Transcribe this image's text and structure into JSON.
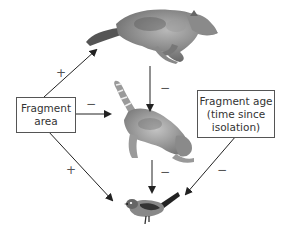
{
  "diagram": {
    "nodes": {
      "fragment_area": {
        "lines": [
          "Fragment",
          "area"
        ]
      },
      "fragment_age": {
        "lines": [
          "Fragment age",
          "(time since",
          "isolation)"
        ]
      },
      "coyote": {
        "label": "coyote (top predator)"
      },
      "cat": {
        "label": "cat (mesopredator)"
      },
      "bird": {
        "label": "songbird (prey)"
      }
    },
    "edges": [
      {
        "from": "fragment_area",
        "to": "coyote",
        "sign": "+"
      },
      {
        "from": "fragment_area",
        "to": "cat",
        "sign": "−"
      },
      {
        "from": "fragment_area",
        "to": "bird",
        "sign": "+"
      },
      {
        "from": "coyote",
        "to": "cat",
        "sign": "−"
      },
      {
        "from": "cat",
        "to": "bird",
        "sign": "−"
      },
      {
        "from": "fragment_age",
        "to": "bird",
        "sign": "−"
      }
    ],
    "colors": {
      "line": "#222222",
      "box_border": "#555555",
      "text": "#333333"
    }
  }
}
